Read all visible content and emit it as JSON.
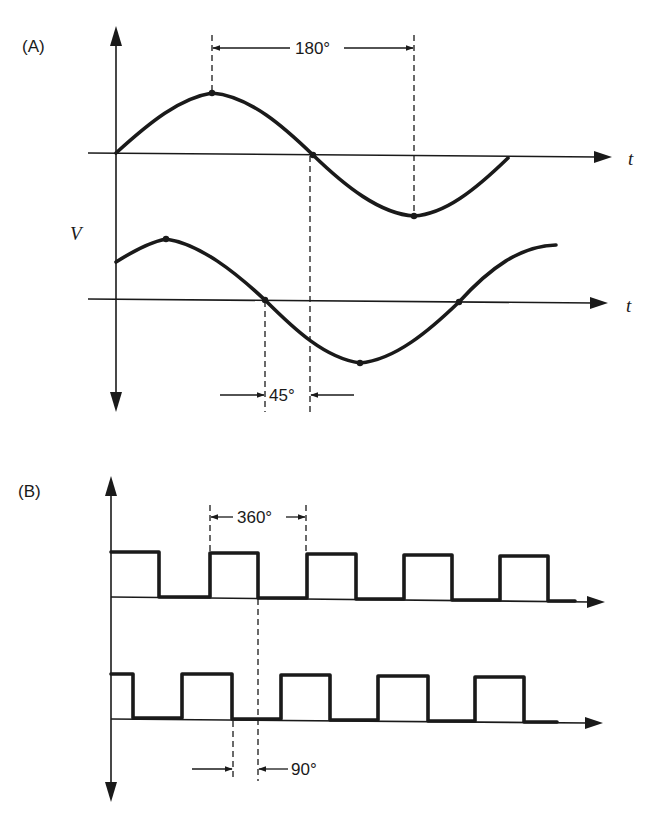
{
  "figure": {
    "panel_a": {
      "label": "(A)",
      "y_axis_label": "V",
      "x_axis_label_top": "t",
      "x_axis_label_bottom": "t",
      "period_annotation": "180°",
      "phase_shift_annotation": "45°",
      "waves": [
        {
          "name": "reference sine",
          "points": [
            "origin zero-crossing",
            "peak",
            "zero-crossing",
            "trough"
          ]
        },
        {
          "name": "shifted sine (leading 45°)",
          "points": [
            "peak",
            "zero-crossing",
            "trough",
            "zero-crossing"
          ]
        }
      ]
    },
    "panel_b": {
      "label": "(B)",
      "period_annotation": "360°",
      "phase_shift_annotation": "90°",
      "waves": [
        {
          "name": "reference square wave",
          "pulses": 5
        },
        {
          "name": "shifted square wave (leading 90°)",
          "pulses": 5
        }
      ]
    },
    "colors": {
      "ink": "#1a1a1a",
      "background": "#ffffff"
    }
  }
}
